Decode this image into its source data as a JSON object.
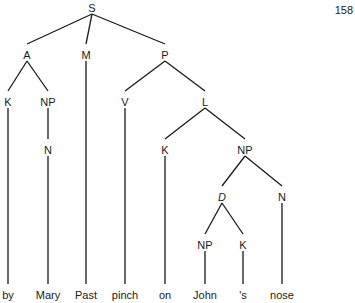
{
  "page_number": "158",
  "tree": {
    "nodes": [
      {
        "id": "S",
        "label": "S",
        "x": 92,
        "y": 8,
        "italic": false
      },
      {
        "id": "A",
        "label": "A",
        "x": 27,
        "y": 55,
        "italic": false
      },
      {
        "id": "M",
        "label": "M",
        "x": 86,
        "y": 55,
        "italic": false
      },
      {
        "id": "P",
        "label": "P",
        "x": 165,
        "y": 55,
        "italic": false
      },
      {
        "id": "K1",
        "label": "K",
        "x": 8,
        "y": 102,
        "italic": false
      },
      {
        "id": "NP1",
        "label": "NP",
        "x": 48,
        "y": 102,
        "italic": false
      },
      {
        "id": "V",
        "label": "V",
        "x": 125,
        "y": 102,
        "italic": false
      },
      {
        "id": "L",
        "label": "L",
        "x": 205,
        "y": 102,
        "italic": false
      },
      {
        "id": "N1",
        "label": "N",
        "x": 48,
        "y": 150,
        "italic": false
      },
      {
        "id": "K2",
        "label": "K",
        "x": 165,
        "y": 150,
        "italic": false
      },
      {
        "id": "NP2",
        "label": "NP",
        "x": 245,
        "y": 150,
        "italic": false
      },
      {
        "id": "D",
        "label": "D",
        "x": 222,
        "y": 197,
        "italic": true
      },
      {
        "id": "N2",
        "label": "N",
        "x": 282,
        "y": 197,
        "italic": false
      },
      {
        "id": "NP3",
        "label": "NP",
        "x": 205,
        "y": 245,
        "italic": false
      },
      {
        "id": "K3",
        "label": "K",
        "x": 243,
        "y": 245,
        "italic": false
      },
      {
        "id": "w_by",
        "label": "by",
        "x": 8,
        "y": 295,
        "italic": false
      },
      {
        "id": "w_mary",
        "label": "Mary",
        "x": 48,
        "y": 295,
        "italic": false
      },
      {
        "id": "w_past",
        "label": "Past",
        "x": 86,
        "y": 295,
        "italic": false
      },
      {
        "id": "w_pinch",
        "label": "pinch",
        "x": 125,
        "y": 295,
        "italic": false
      },
      {
        "id": "w_on",
        "label": "on",
        "x": 165,
        "y": 295,
        "italic": false
      },
      {
        "id": "w_john",
        "label": "John",
        "x": 205,
        "y": 295,
        "italic": false
      },
      {
        "id": "w_s",
        "label": "'s",
        "x": 243,
        "y": 295,
        "italic": false
      },
      {
        "id": "w_nose",
        "label": "nose",
        "x": 282,
        "y": 295,
        "italic": false
      }
    ],
    "edges": [
      [
        "S",
        "A"
      ],
      [
        "S",
        "M"
      ],
      [
        "S",
        "P"
      ],
      [
        "A",
        "K1"
      ],
      [
        "A",
        "NP1"
      ],
      [
        "K1",
        "w_by"
      ],
      [
        "NP1",
        "N1"
      ],
      [
        "N1",
        "w_mary"
      ],
      [
        "M",
        "w_past"
      ],
      [
        "P",
        "V"
      ],
      [
        "P",
        "L"
      ],
      [
        "V",
        "w_pinch"
      ],
      [
        "L",
        "K2"
      ],
      [
        "L",
        "NP2"
      ],
      [
        "K2",
        "w_on"
      ],
      [
        "NP2",
        "D"
      ],
      [
        "NP2",
        "N2"
      ],
      [
        "D",
        "NP3"
      ],
      [
        "D",
        "K3"
      ],
      [
        "NP3",
        "w_john"
      ],
      [
        "K3",
        "w_s"
      ],
      [
        "N2",
        "w_nose"
      ]
    ]
  }
}
